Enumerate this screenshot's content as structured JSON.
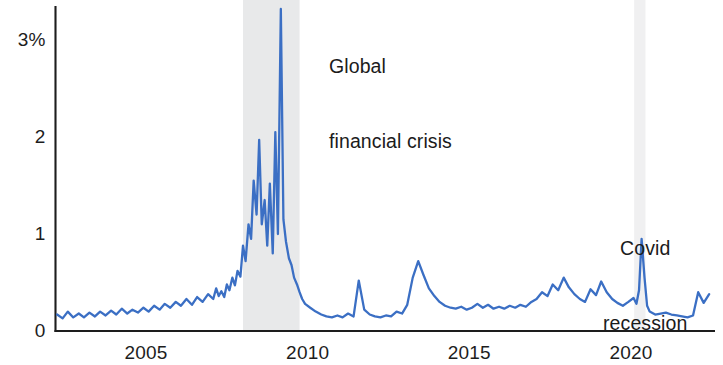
{
  "figure": {
    "background_color": "#ffffff",
    "line_color": "#3b6fc4",
    "axis_color": "#1d1d1d",
    "recession_band_color": "#e8e9ea"
  },
  "annotations": {
    "gfc_line1": "Global",
    "gfc_line2": "financial crisis",
    "covid_line1": "Covid",
    "covid_line2": "recession"
  },
  "axes": {
    "y_ticks": [
      {
        "label": "3%",
        "value": 3
      },
      {
        "label": "2",
        "value": 2
      },
      {
        "label": "1",
        "value": 1
      },
      {
        "label": "0",
        "value": 0
      }
    ],
    "x_ticks": [
      {
        "label": "2005",
        "value": 2005
      },
      {
        "label": "2010",
        "value": 2010
      },
      {
        "label": "2015",
        "value": 2015
      },
      {
        "label": "2020",
        "value": 2020
      }
    ]
  },
  "chart_data": {
    "type": "line",
    "title": "",
    "subtitle": "",
    "xlabel": "",
    "ylabel": "",
    "ylim": [
      0,
      3.35
    ],
    "xlim": [
      2002.2,
      2022.6
    ],
    "grid": false,
    "legend": false,
    "y_unit": "percent",
    "y_tick_values": [
      0,
      1,
      2,
      3
    ],
    "y_tick_labels": [
      "0",
      "1",
      "2",
      "3%"
    ],
    "x_tick_values": [
      2005,
      2010,
      2015,
      2020
    ],
    "x_tick_labels": [
      "2005",
      "2010",
      "2015",
      "2020"
    ],
    "shaded_regions": [
      {
        "name": "Global financial crisis",
        "x_start": 2008.0,
        "x_end": 2009.75,
        "color": "#e8e9ea"
      },
      {
        "name": "Covid recession",
        "x_start": 2020.1,
        "x_end": 2020.45,
        "color": "#f0f0f1"
      }
    ],
    "annotations": [
      {
        "text": "Global financial crisis",
        "x": 2010.1,
        "y": 3.15
      },
      {
        "text": "Covid recession",
        "x": 2020.5,
        "y": 1.45
      }
    ],
    "series": [
      {
        "name": "series",
        "color": "#3b6fc4",
        "x": [
          2002.25,
          2002.42,
          2002.58,
          2002.75,
          2002.92,
          2003.08,
          2003.25,
          2003.42,
          2003.58,
          2003.75,
          2003.92,
          2004.08,
          2004.25,
          2004.42,
          2004.58,
          2004.75,
          2004.92,
          2005.08,
          2005.25,
          2005.42,
          2005.58,
          2005.75,
          2005.92,
          2006.08,
          2006.25,
          2006.42,
          2006.58,
          2006.75,
          2006.92,
          2007.08,
          2007.17,
          2007.25,
          2007.33,
          2007.42,
          2007.5,
          2007.58,
          2007.67,
          2007.75,
          2007.83,
          2007.92,
          2008.0,
          2008.08,
          2008.17,
          2008.25,
          2008.33,
          2008.42,
          2008.5,
          2008.58,
          2008.67,
          2008.75,
          2008.83,
          2008.92,
          2009.0,
          2009.08,
          2009.17,
          2009.25,
          2009.33,
          2009.42,
          2009.5,
          2009.58,
          2009.67,
          2009.75,
          2009.83,
          2009.92,
          2010.08,
          2010.25,
          2010.42,
          2010.58,
          2010.75,
          2010.92,
          2011.08,
          2011.25,
          2011.42,
          2011.58,
          2011.75,
          2011.92,
          2012.08,
          2012.25,
          2012.42,
          2012.58,
          2012.75,
          2012.92,
          2013.08,
          2013.25,
          2013.42,
          2013.58,
          2013.75,
          2013.92,
          2014.08,
          2014.25,
          2014.42,
          2014.58,
          2014.75,
          2014.92,
          2015.08,
          2015.25,
          2015.42,
          2015.58,
          2015.75,
          2015.92,
          2016.08,
          2016.25,
          2016.42,
          2016.58,
          2016.75,
          2016.92,
          2017.08,
          2017.25,
          2017.42,
          2017.58,
          2017.75,
          2017.92,
          2018.08,
          2018.25,
          2018.42,
          2018.58,
          2018.75,
          2018.92,
          2019.08,
          2019.25,
          2019.42,
          2019.58,
          2019.75,
          2019.92,
          2020.08,
          2020.17,
          2020.25,
          2020.33,
          2020.42,
          2020.5,
          2020.58,
          2020.75,
          2020.92,
          2021.08,
          2021.25,
          2021.42,
          2021.58,
          2021.75,
          2021.92,
          2022.08,
          2022.25,
          2022.42
        ],
        "y": [
          0.17,
          0.13,
          0.2,
          0.14,
          0.18,
          0.14,
          0.19,
          0.15,
          0.2,
          0.16,
          0.21,
          0.17,
          0.23,
          0.18,
          0.22,
          0.19,
          0.24,
          0.2,
          0.26,
          0.22,
          0.28,
          0.24,
          0.3,
          0.26,
          0.33,
          0.27,
          0.35,
          0.3,
          0.38,
          0.33,
          0.44,
          0.36,
          0.41,
          0.35,
          0.48,
          0.42,
          0.55,
          0.47,
          0.62,
          0.56,
          0.88,
          0.72,
          1.1,
          0.95,
          1.55,
          1.2,
          1.97,
          1.1,
          1.35,
          0.88,
          1.52,
          0.8,
          2.05,
          1.0,
          3.32,
          1.15,
          0.92,
          0.75,
          0.68,
          0.55,
          0.48,
          0.4,
          0.33,
          0.28,
          0.24,
          0.2,
          0.17,
          0.15,
          0.14,
          0.16,
          0.14,
          0.18,
          0.15,
          0.52,
          0.22,
          0.17,
          0.15,
          0.14,
          0.16,
          0.15,
          0.2,
          0.18,
          0.27,
          0.55,
          0.72,
          0.58,
          0.44,
          0.36,
          0.3,
          0.26,
          0.24,
          0.23,
          0.25,
          0.22,
          0.24,
          0.28,
          0.24,
          0.27,
          0.23,
          0.25,
          0.23,
          0.26,
          0.24,
          0.27,
          0.25,
          0.3,
          0.33,
          0.4,
          0.36,
          0.48,
          0.42,
          0.55,
          0.45,
          0.38,
          0.33,
          0.3,
          0.43,
          0.37,
          0.51,
          0.4,
          0.33,
          0.29,
          0.26,
          0.3,
          0.34,
          0.28,
          0.42,
          0.95,
          0.55,
          0.26,
          0.2,
          0.17,
          0.18,
          0.19,
          0.17,
          0.16,
          0.15,
          0.14,
          0.16,
          0.4,
          0.29,
          0.38
        ]
      }
    ]
  }
}
